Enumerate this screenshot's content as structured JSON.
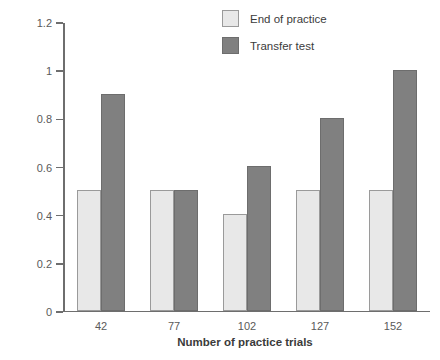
{
  "chart_data": {
    "type": "bar",
    "title": "",
    "xlabel": "Number of practice trials",
    "ylabel": "Absolute error (in.)",
    "categories": [
      "42",
      "77",
      "102",
      "127",
      "152"
    ],
    "series": [
      {
        "name": "End of practice",
        "color": "#e8e8e8",
        "values": [
          0.5,
          0.5,
          0.4,
          0.5,
          0.5
        ]
      },
      {
        "name": "Transfer test",
        "color": "#808080",
        "values": [
          0.9,
          0.5,
          0.6,
          0.8,
          1.0
        ]
      }
    ],
    "ylim": [
      0,
      1.2
    ],
    "yticks": [
      0,
      0.2,
      0.4,
      0.6,
      0.8,
      1,
      1.2
    ],
    "ytick_labels": [
      "0",
      "0.2",
      "0.4",
      "0.6",
      "0.8",
      "1",
      "1.2"
    ],
    "grid": false,
    "legend_position": "top-right"
  }
}
